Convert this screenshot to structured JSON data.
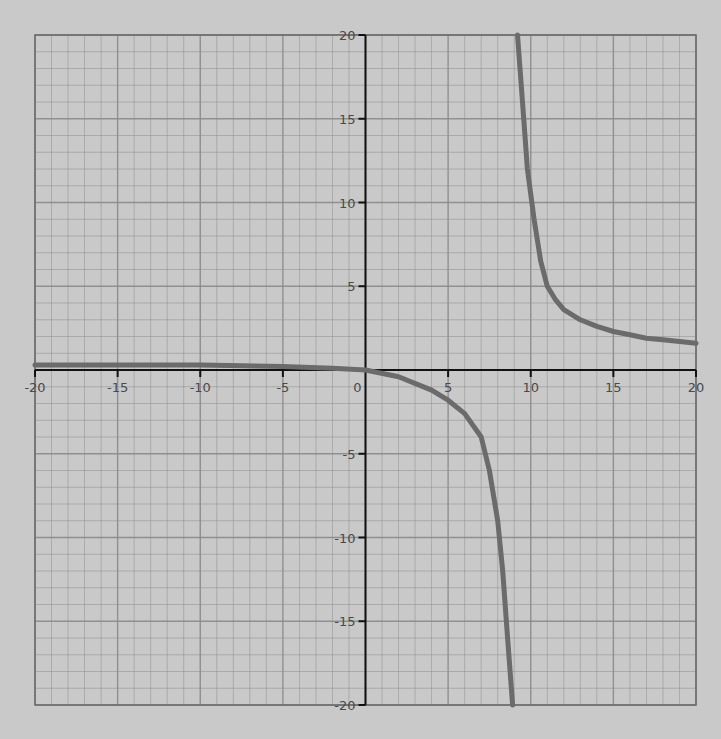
{
  "chart_data": {
    "type": "line",
    "title": "",
    "xlabel": "",
    "ylabel": "",
    "xlim": [
      -20,
      20
    ],
    "ylim": [
      -20,
      20
    ],
    "grid": true,
    "grid_minor_step": 1,
    "grid_major_step": 5,
    "x_ticks": [
      -20,
      -15,
      -10,
      -5,
      0,
      5,
      10,
      15,
      20
    ],
    "x_tick_labels": [
      "-20",
      "-15",
      "-10",
      "-5",
      "0",
      "5",
      "10",
      "15",
      "20"
    ],
    "y_ticks": [
      20,
      15,
      10,
      5,
      -5,
      -10,
      -15,
      -20
    ],
    "y_tick_labels": [
      "20",
      "15",
      "10",
      "5",
      "-5",
      "-10",
      "-15",
      "-20"
    ],
    "annotations": [
      "vertical asymptote near x ≈ 9"
    ],
    "series": [
      {
        "name": "left branch",
        "x": [
          -20,
          -15,
          -10,
          -5,
          -2,
          0,
          2,
          4,
          5,
          6,
          7,
          7.5,
          8,
          8.3,
          8.6,
          8.9
        ],
        "y": [
          0.3,
          0.3,
          0.3,
          0.2,
          0.1,
          0,
          -0.4,
          -1.2,
          -1.8,
          -2.6,
          -4,
          -6,
          -9,
          -12,
          -16,
          -20
        ]
      },
      {
        "name": "right branch",
        "x": [
          9.2,
          9.5,
          9.8,
          10.2,
          10.6,
          11,
          11.5,
          12,
          13,
          14,
          15,
          16,
          17,
          18,
          19,
          20
        ],
        "y": [
          20,
          16,
          12,
          9,
          6.5,
          5,
          4.2,
          3.6,
          3.0,
          2.6,
          2.3,
          2.1,
          1.9,
          1.8,
          1.7,
          1.6
        ]
      }
    ],
    "colors": {
      "background": "#c9c9c9",
      "grid": "#8a8a8a",
      "axis": "#111111",
      "curve": "#6b6b6b"
    }
  }
}
